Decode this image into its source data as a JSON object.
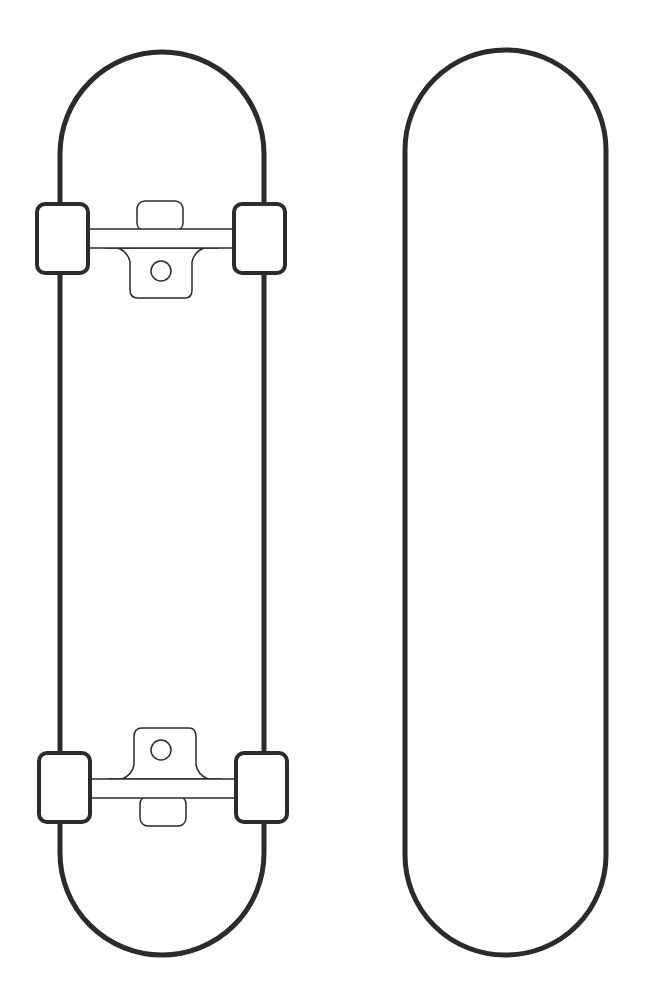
{
  "illustration": {
    "subject": "Skateboard outline template",
    "stroke_color": "#2b2b2b",
    "fill_color": "#ffffff",
    "items": [
      {
        "name": "Skateboard bottom view with trucks and wheels"
      },
      {
        "name": "Skateboard deck blank outline"
      }
    ]
  }
}
